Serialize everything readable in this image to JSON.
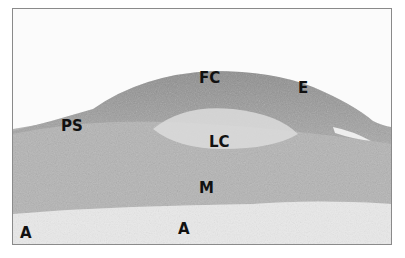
{
  "figure": {
    "labels": {
      "fc": "FC",
      "e": "E",
      "ps": "PS",
      "lc": "LC",
      "m": "M",
      "a_left": "A",
      "a_center": "A"
    }
  }
}
